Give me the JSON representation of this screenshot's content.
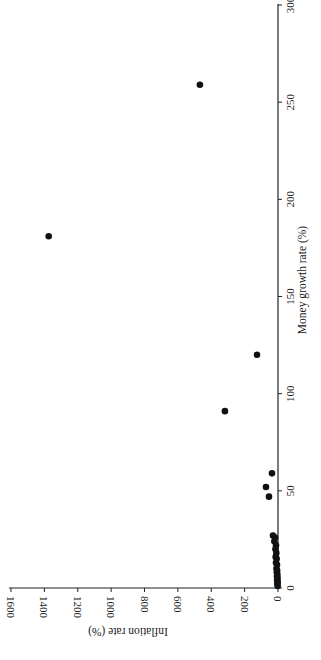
{
  "chart_data": {
    "type": "scatter",
    "title": "",
    "xlabel": "Money growth rate (%)",
    "ylabel": "Inflation rate (%)",
    "xlim": [
      0,
      300
    ],
    "ylim": [
      0,
      1600
    ],
    "xticks": [
      0,
      50,
      100,
      150,
      200,
      250,
      300
    ],
    "yticks": [
      0,
      200,
      400,
      600,
      800,
      1000,
      1200,
      1400,
      1600
    ],
    "grid": false,
    "legend": null,
    "orientation": "rotated 90 degrees (money growth axis vertical on right, inflation axis along bottom with inverted labels)",
    "points": [
      {
        "x": 259,
        "y": 468
      },
      {
        "x": 181,
        "y": 1374
      },
      {
        "x": 120,
        "y": 126
      },
      {
        "x": 91,
        "y": 318
      },
      {
        "x": 59,
        "y": 36
      },
      {
        "x": 52,
        "y": 72
      },
      {
        "x": 47,
        "y": 54
      },
      {
        "x": 27,
        "y": 30
      },
      {
        "x": 26,
        "y": 18
      },
      {
        "x": 24,
        "y": 22
      },
      {
        "x": 22,
        "y": 12
      },
      {
        "x": 20,
        "y": 15
      },
      {
        "x": 18,
        "y": 10
      },
      {
        "x": 16,
        "y": 14
      },
      {
        "x": 15,
        "y": 8
      },
      {
        "x": 13,
        "y": 12
      },
      {
        "x": 12,
        "y": 6
      },
      {
        "x": 10,
        "y": 9
      },
      {
        "x": 9,
        "y": 5
      },
      {
        "x": 8,
        "y": 7
      },
      {
        "x": 7,
        "y": 4
      },
      {
        "x": 6,
        "y": 6
      },
      {
        "x": 5,
        "y": 3
      },
      {
        "x": 4,
        "y": 5
      },
      {
        "x": 3,
        "y": 2
      },
      {
        "x": 2,
        "y": 4
      },
      {
        "x": 1,
        "y": 2
      }
    ]
  },
  "labels": {
    "x_title": "Money growth rate (%)",
    "y_title": "Inflation rate (%)"
  }
}
